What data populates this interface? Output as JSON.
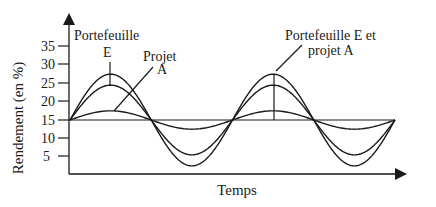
{
  "chart_data": {
    "type": "line",
    "title": "",
    "xlabel": "Temps",
    "ylabel": "Rendement (en %)",
    "yticks": [
      "35",
      "30",
      "25",
      "20",
      "15",
      "10",
      "5"
    ],
    "ylim": [
      0,
      40
    ],
    "grid": false,
    "baseline": 15,
    "series": [
      {
        "name": "Portefeuille E (outer)",
        "mean": 15,
        "amplitude": 12.5,
        "peak": 27.5,
        "trough": 2.5
      },
      {
        "name": "Portefeuille E (inner)",
        "mean": 15,
        "amplitude": 9.5,
        "peak": 24.5,
        "trough": 5.5
      },
      {
        "name": "Projet A",
        "mean": 15,
        "amplitude": 2.5,
        "peak": 17.5,
        "trough": 12.5
      }
    ],
    "periods": 2,
    "annotations": [
      {
        "text_lines": [
          "Portefeuille",
          "E"
        ],
        "points_to": "first peak of E curves"
      },
      {
        "text_lines": [
          "Projet",
          "A"
        ],
        "points_to": "first peak of Projet A"
      },
      {
        "text_lines": [
          "Portefeuille E et",
          "projet A"
        ],
        "points_to": "second peak"
      }
    ]
  },
  "labels": {
    "ylabel": "Rendement (en %)",
    "xlabel": "Temps",
    "ann1_line1": "Portefeuille",
    "ann1_line2": "E",
    "ann2_line1": "Projet",
    "ann2_line2": "A",
    "ann3_line1": "Portefeuille E et",
    "ann3_line2": "projet A",
    "tick_35": "35",
    "tick_30": "30",
    "tick_25": "25",
    "tick_20": "20",
    "tick_15": "15",
    "tick_10": "10",
    "tick_5": "5"
  }
}
